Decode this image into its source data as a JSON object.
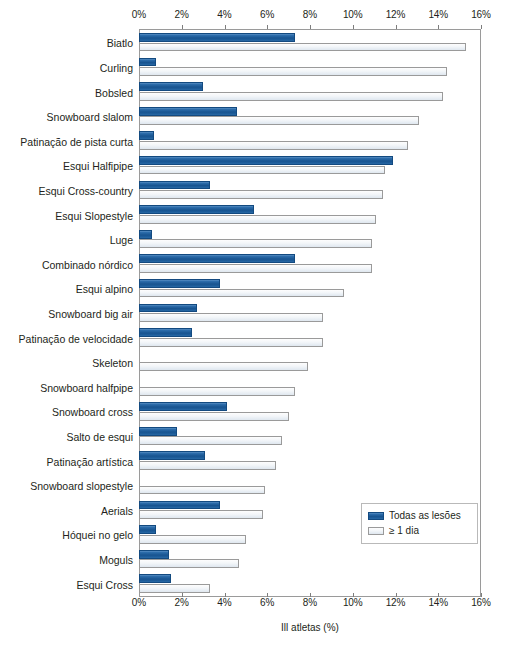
{
  "chart_data": {
    "type": "bar",
    "orientation": "horizontal",
    "title": "",
    "xlabel": "Ill atletas (%)",
    "ylabel": "",
    "xlim": [
      0,
      16
    ],
    "xunit": "%",
    "xticks": [
      0,
      2,
      4,
      6,
      8,
      10,
      12,
      14,
      16
    ],
    "xtick_labels": [
      "0%",
      "2%",
      "4%",
      "6%",
      "8%",
      "10%",
      "12%",
      "14%",
      "16%"
    ],
    "grid": false,
    "legend_position": "bottom-right",
    "categories": [
      "Biatlo",
      "Curling",
      "Bobsled",
      "Snowboard slalom",
      "Patinação de pista curta",
      "Esqui Halfipipe",
      "Esqui Cross-country",
      "Esqui Slopestyle",
      "Luge",
      "Combinado nórdico",
      "Esqui alpino",
      "Snowboard big air",
      "Patinação de velocidade",
      "Skeleton",
      "Snowboard halfpipe",
      "Snowboard cross",
      "Salto de esqui",
      "Patinação artística",
      "Snowboard slopestyle",
      "Aerials",
      "Hóquei no gelo",
      "Moguls",
      "Esqui Cross"
    ],
    "series": [
      {
        "name": "Todas as lesões",
        "color": "#1f5e9b",
        "values": [
          7.3,
          0.8,
          3.0,
          4.6,
          0.7,
          11.9,
          3.3,
          5.4,
          0.6,
          7.3,
          3.8,
          2.7,
          2.5,
          0.0,
          0.0,
          4.1,
          1.8,
          3.1,
          0.0,
          3.8,
          0.8,
          1.4,
          1.5
        ]
      },
      {
        "name": "≥ 1 dia",
        "color": "#e8eef4",
        "values": [
          15.3,
          14.4,
          14.2,
          13.1,
          12.6,
          11.5,
          11.4,
          11.1,
          10.9,
          10.9,
          9.6,
          8.6,
          8.6,
          7.9,
          7.3,
          7.0,
          6.7,
          6.4,
          5.9,
          5.8,
          5.0,
          4.7,
          3.3
        ]
      }
    ]
  },
  "legend": {
    "items": [
      {
        "label": "Todas as lesões",
        "swatch": "all"
      },
      {
        "label": "≥ 1 dia",
        "swatch": "day"
      }
    ]
  }
}
